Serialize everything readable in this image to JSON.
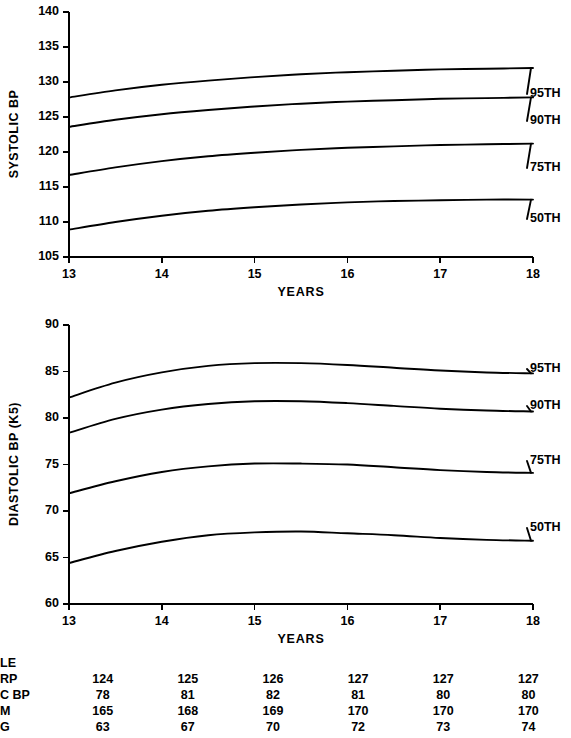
{
  "chart_data": [
    {
      "type": "line",
      "id": "systolic",
      "title": "",
      "xlabel": "YEARS",
      "ylabel": "SYSTOLIC BP",
      "xlim": [
        13,
        18
      ],
      "ylim": [
        105,
        140
      ],
      "xticks": [
        "13",
        "14",
        "15",
        "16",
        "17",
        "18"
      ],
      "yticks": [
        "105",
        "110",
        "115",
        "120",
        "125",
        "130",
        "135",
        "140"
      ],
      "grid": false,
      "legend_position": "right-of-axes",
      "x": [
        13,
        13.5,
        14,
        14.5,
        15,
        15.5,
        16,
        16.5,
        17,
        17.5,
        18
      ],
      "series": [
        {
          "name": "95TH",
          "values": [
            127.8,
            128.8,
            129.6,
            130.2,
            130.7,
            131.1,
            131.4,
            131.6,
            131.8,
            131.9,
            132.0
          ]
        },
        {
          "name": "90TH",
          "values": [
            123.6,
            124.6,
            125.4,
            126.0,
            126.5,
            126.9,
            127.2,
            127.4,
            127.6,
            127.7,
            127.8
          ]
        },
        {
          "name": "75TH",
          "values": [
            116.7,
            117.8,
            118.7,
            119.4,
            119.9,
            120.3,
            120.6,
            120.8,
            121.0,
            121.1,
            121.2
          ]
        },
        {
          "name": "50TH",
          "values": [
            108.9,
            110.0,
            110.9,
            111.6,
            112.1,
            112.5,
            112.8,
            113.0,
            113.1,
            113.2,
            113.2
          ]
        }
      ]
    },
    {
      "type": "line",
      "id": "diastolic",
      "title": "",
      "xlabel": "YEARS",
      "ylabel": "DIASTOLIC BP (K5)",
      "xlim": [
        13,
        18
      ],
      "ylim": [
        60,
        90
      ],
      "xticks": [
        "13",
        "14",
        "15",
        "16",
        "17",
        "18"
      ],
      "yticks": [
        "60",
        "65",
        "70",
        "75",
        "80",
        "85",
        "90"
      ],
      "grid": false,
      "legend_position": "right-of-axes",
      "x": [
        13,
        13.5,
        14,
        14.5,
        15,
        15.5,
        16,
        16.5,
        17,
        17.5,
        18
      ],
      "series": [
        {
          "name": "95TH",
          "values": [
            82.2,
            83.8,
            84.9,
            85.6,
            85.9,
            85.9,
            85.7,
            85.4,
            85.1,
            84.9,
            84.8
          ]
        },
        {
          "name": "90TH",
          "values": [
            78.4,
            79.9,
            80.9,
            81.5,
            81.8,
            81.8,
            81.6,
            81.3,
            81.0,
            80.8,
            80.7
          ]
        },
        {
          "name": "75TH",
          "values": [
            71.9,
            73.2,
            74.2,
            74.8,
            75.1,
            75.1,
            75.0,
            74.7,
            74.4,
            74.2,
            74.1
          ]
        },
        {
          "name": "50TH",
          "values": [
            64.4,
            65.7,
            66.7,
            67.4,
            67.7,
            67.8,
            67.6,
            67.4,
            67.1,
            66.9,
            66.8
          ]
        }
      ]
    }
  ],
  "table": {
    "title": "LE",
    "rows": [
      {
        "label": "RP",
        "values": [
          "124",
          "125",
          "126",
          "127",
          "127",
          "127"
        ]
      },
      {
        "label": "C BP",
        "values": [
          "78",
          "81",
          "82",
          "81",
          "80",
          "80"
        ]
      },
      {
        "label": "M",
        "values": [
          "165",
          "168",
          "169",
          "170",
          "170",
          "170"
        ]
      },
      {
        "label": "G",
        "values": [
          "63",
          "67",
          "70",
          "72",
          "73",
          "74"
        ]
      }
    ]
  },
  "colors": {
    "ink": "#000000",
    "background": "#ffffff"
  }
}
